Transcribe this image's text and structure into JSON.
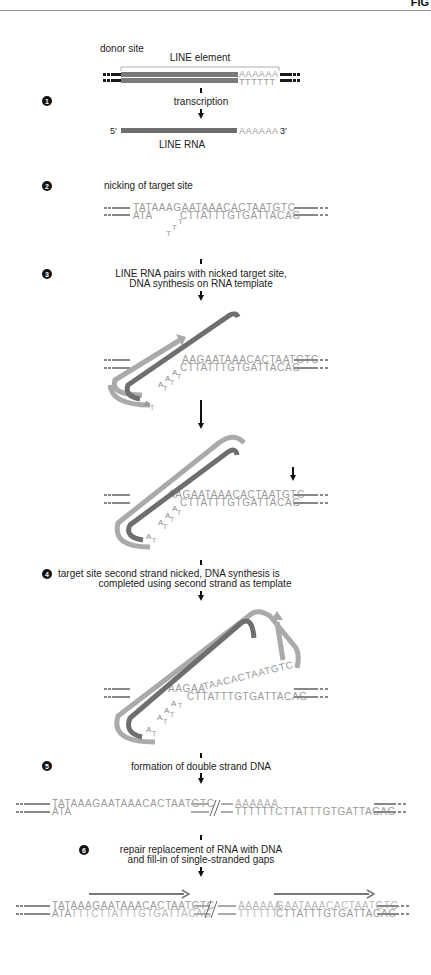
{
  "header": {
    "corner_text": "FIG"
  },
  "colors": {
    "dark_strand": "#707070",
    "light_strand": "#a8a8a8",
    "black_flank": "#1a1a1a",
    "sequence_text": "#9a9a9a",
    "label_text": "#222222"
  },
  "step0": {
    "donor_label": "donor site",
    "line_element_label": "LINE element",
    "top_polyA": "AAAAAA",
    "bottom_polyT": "TTTTTT"
  },
  "steps": [
    {
      "number": "1",
      "label_lines": [
        "transcription"
      ]
    },
    {
      "number": "2",
      "label_lines": [
        "nicking of target site"
      ]
    },
    {
      "number": "3",
      "label_lines": [
        "LINE RNA pairs with nicked target site,",
        "DNA synthesis on RNA template"
      ]
    },
    {
      "number": "4",
      "label_lines": [
        "target site second strand nicked, DNA synthesis is",
        "completed using second strand as template"
      ]
    },
    {
      "number": "5",
      "label_lines": [
        "formation of double strand DNA"
      ]
    },
    {
      "number": "6",
      "label_lines": [
        "repair replacement of RNA with DNA",
        "and fill-in of single-stranded gaps"
      ]
    }
  ],
  "rna": {
    "five_prime": "5′",
    "three_prime": "3′",
    "polyA": "AAAAAA",
    "label": "LINE RNA"
  },
  "target": {
    "top_strand": "TATAAAGAATAAACACTAATGTC",
    "top_strand_partial": "AAGAATAAACACTAATGTC",
    "top_strand_partial_step4": "AAGAA",
    "top_strand_flipped_step4": "TAACACTAATGTC",
    "bottom_left": "ATA",
    "bottom_right": "CTTATTTGTGATTACAG",
    "hanging_T": [
      "T",
      "T",
      "T"
    ],
    "paired_A": [
      "A",
      "A",
      "A",
      "A"
    ],
    "paired_T": [
      "T",
      "T",
      "T",
      "T"
    ]
  },
  "step5": {
    "left_top": "TATAAAGAATAAACACTAATGTC",
    "left_bottom": "ATA",
    "right_top": "AAAAAA",
    "right_bottom": "TTTTTTCTTATTTGTGATTACAG"
  },
  "step6": {
    "left_top_dark": "TATAAAGAATAAACACTAATGTC",
    "left_bottom_dark": "ATA",
    "left_bottom_light": "TTTCTTATTTGTGATTACAG",
    "right_top_light": "AAAAAA",
    "right_top_dark": "GAATAAACACTAATGTC",
    "right_bottom_light": "TTTTTT",
    "right_bottom_dark": "CTTATTTGTGATTACAG"
  }
}
